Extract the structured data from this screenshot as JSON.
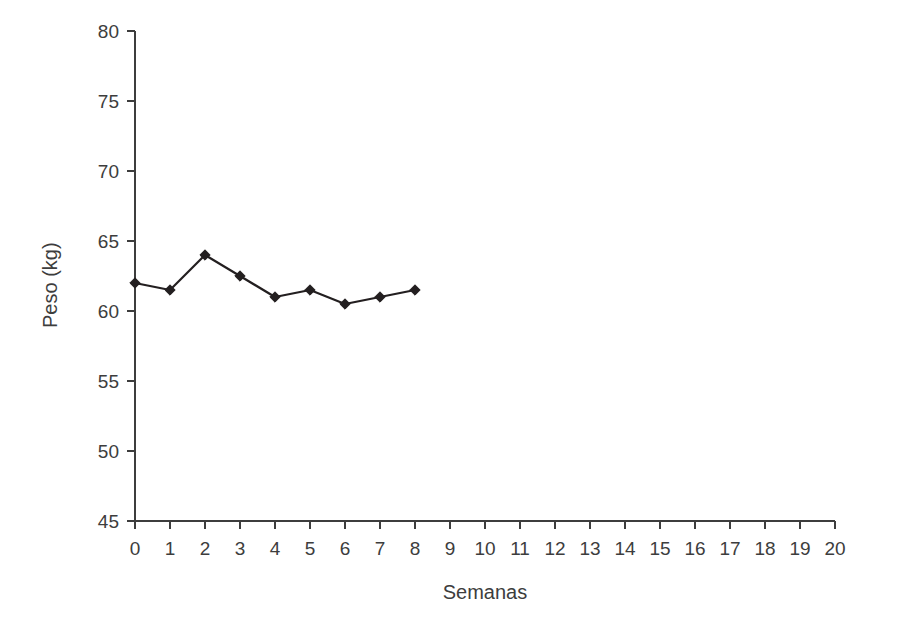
{
  "chart_data": {
    "type": "line",
    "title": "",
    "xlabel": "Semanas",
    "ylabel": "Peso (kg)",
    "xlim": [
      0,
      20
    ],
    "ylim": [
      45,
      80
    ],
    "xticks": [
      0,
      1,
      2,
      3,
      4,
      5,
      6,
      7,
      8,
      9,
      10,
      11,
      12,
      13,
      14,
      15,
      16,
      17,
      18,
      19,
      20
    ],
    "yticks": [
      45,
      50,
      55,
      60,
      65,
      70,
      75,
      80
    ],
    "xtick_labels": [
      "0",
      "1",
      "2",
      "3",
      "4",
      "5",
      "6",
      "7",
      "8",
      "9",
      "10",
      "11",
      "12",
      "13",
      "14",
      "15",
      "16",
      "17",
      "18",
      "19",
      "20"
    ],
    "ytick_labels": [
      "45",
      "50",
      "55",
      "60",
      "65",
      "70",
      "75",
      "80"
    ],
    "grid": false,
    "legend": false,
    "marker": "diamond",
    "line_color": "#231f20",
    "marker_color": "#231f20",
    "axis_color": "#3d3d3d",
    "background_color": "#ffffff",
    "x": [
      0,
      1,
      2,
      3,
      4,
      5,
      6,
      7,
      8
    ],
    "series": [
      {
        "name": "Peso",
        "values": [
          62.0,
          61.5,
          64.0,
          62.5,
          61.0,
          61.5,
          60.5,
          61.0,
          61.5
        ]
      }
    ]
  }
}
